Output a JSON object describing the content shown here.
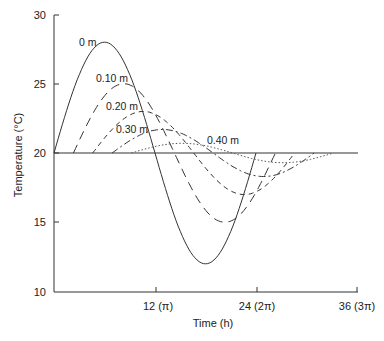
{
  "chart_data": {
    "type": "line",
    "title": "",
    "xlabel": "Time (h)",
    "ylabel": "Temperature (°C)",
    "xlim": [
      0,
      36
    ],
    "ylim": [
      10,
      30
    ],
    "grid": false,
    "legend_position": "inline labels",
    "x_ticks": [
      {
        "value": 12,
        "label": "12 (π)"
      },
      {
        "value": 24,
        "label": "24 (2π)"
      },
      {
        "value": 36,
        "label": "36 (3π)"
      }
    ],
    "y_ticks": [
      {
        "value": 10,
        "label": "10"
      },
      {
        "value": 15,
        "label": "15"
      },
      {
        "value": 20,
        "label": "20"
      },
      {
        "value": 25,
        "label": "25"
      },
      {
        "value": 30,
        "label": "30"
      }
    ],
    "baseline": 20,
    "series": [
      {
        "name": "0 m",
        "style": "solid",
        "amplitude": 8.0,
        "lag_h": 0.0,
        "period_h": 24,
        "peak": 28.0,
        "trough": 12.2
      },
      {
        "name": "0.10 m",
        "style": "long-dash",
        "amplitude": 5.0,
        "lag_h": 2.3,
        "period_h": 24,
        "peak": 25.0,
        "trough": 15.1
      },
      {
        "name": "0.20 m",
        "style": "dash",
        "amplitude": 3.0,
        "lag_h": 4.6,
        "period_h": 24,
        "peak": 23.0,
        "trough": 17.2
      },
      {
        "name": "0.30 m",
        "style": "dash-dot",
        "amplitude": 1.7,
        "lag_h": 6.9,
        "period_h": 24,
        "peak": 21.7,
        "trough": 18.4
      },
      {
        "name": "0.40 m",
        "style": "dotted",
        "amplitude": 0.7,
        "lag_h": 9.2,
        "period_h": 24,
        "peak": 20.7,
        "trough": 19.3
      }
    ]
  },
  "labels": {
    "xlabel": "Time (h)",
    "ylabel": "Temperature (°C)",
    "y30": "30",
    "y25": "25",
    "y20": "20",
    "y15": "15",
    "y10": "10",
    "x12": "12 (π)",
    "x24": "24 (2π)",
    "x36": "36 (3π)",
    "c0": "0 m",
    "c1": "0.10 m",
    "c2": "0.20 m",
    "c3": "0.30 m",
    "c4": "0.40 m"
  }
}
